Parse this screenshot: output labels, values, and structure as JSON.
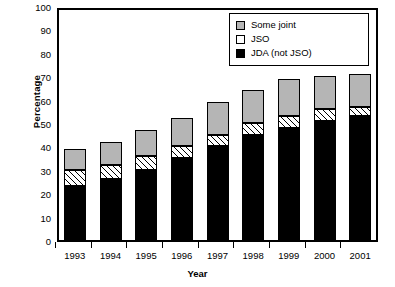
{
  "chart_data": {
    "type": "bar",
    "subtype": "stacked-bar",
    "title": "",
    "xlabel": "Year",
    "ylabel": "Percentage",
    "categories": [
      "1993",
      "1994",
      "1995",
      "1996",
      "1997",
      "1998",
      "1999",
      "2000",
      "2001"
    ],
    "ylim": [
      0,
      100
    ],
    "yticks": [
      0,
      10,
      20,
      30,
      40,
      50,
      60,
      70,
      80,
      90,
      100
    ],
    "grid": false,
    "legend_position": "top-right",
    "series": [
      {
        "name": "JDA (not JSO)",
        "color": "#000000",
        "fill": "solid-black",
        "values": [
          23,
          26,
          30,
          35,
          40,
          45,
          48,
          51,
          53
        ]
      },
      {
        "name": "JSO",
        "color": "#ffffff",
        "fill": "diagonal-hatch",
        "values": [
          7,
          6,
          6,
          5,
          5,
          5,
          5,
          5,
          4
        ]
      },
      {
        "name": "Some joint",
        "color": "#b5b5b5",
        "fill": "solid-gray",
        "values": [
          9,
          10,
          11,
          12,
          14,
          14,
          16,
          14,
          14
        ]
      }
    ],
    "totals": [
      39,
      42,
      47,
      52,
      59,
      64,
      69,
      70,
      71
    ]
  },
  "legend": {
    "items": [
      {
        "label": "Some joint",
        "swatch": "gray-swatch"
      },
      {
        "label": "JSO",
        "swatch": "white-swatch"
      },
      {
        "label": "JDA (not JSO)",
        "swatch": "black-swatch"
      }
    ]
  },
  "axes": {
    "y_title": "Percentage",
    "x_title": "Year",
    "y_tick_labels": [
      "100",
      "90",
      "80",
      "70",
      "60",
      "50",
      "40",
      "30",
      "20",
      "10",
      "0"
    ],
    "x_tick_labels": [
      "1993",
      "1994",
      "1995",
      "1996",
      "1997",
      "1998",
      "1999",
      "2000",
      "2001"
    ]
  }
}
